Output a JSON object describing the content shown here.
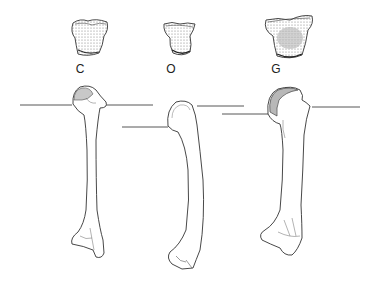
{
  "figure": {
    "specimens": [
      {
        "id": "C",
        "label": "C",
        "label_x": 80,
        "label_y": 62
      },
      {
        "id": "O",
        "label": "O",
        "label_x": 171,
        "label_y": 62
      },
      {
        "id": "G",
        "label": "G",
        "label_x": 276,
        "label_y": 62
      }
    ],
    "colors": {
      "line": "#333333",
      "shading": "#bbbbbb",
      "stipple": "#555555",
      "background": "#ffffff"
    }
  }
}
